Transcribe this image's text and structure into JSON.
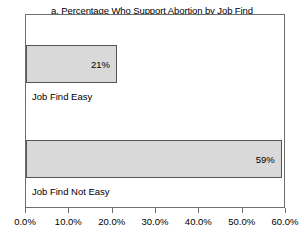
{
  "chart_data": {
    "type": "bar",
    "orientation": "horizontal",
    "title": "a. Percentage Who Support Abortion by Job Find",
    "subtitle": "(column percent)",
    "xlabel": "",
    "ylabel": "",
    "categories": [
      "Job Find Easy",
      "Job Find Not Easy"
    ],
    "values": [
      21,
      59
    ],
    "value_labels": [
      "21%",
      "59%"
    ],
    "xlim": [
      0,
      60
    ],
    "xticks": [
      0,
      10,
      20,
      30,
      40,
      50,
      60
    ],
    "xtick_labels": [
      "0.0%",
      "10.0%",
      "20.0%",
      "30.0%",
      "40.0%",
      "50.0%",
      "60.0%"
    ],
    "grid": false,
    "legend": false,
    "bar_fill_color": "#d9d9d9",
    "bar_border_color": "#555555",
    "frame_color": "#6e6e6e"
  }
}
